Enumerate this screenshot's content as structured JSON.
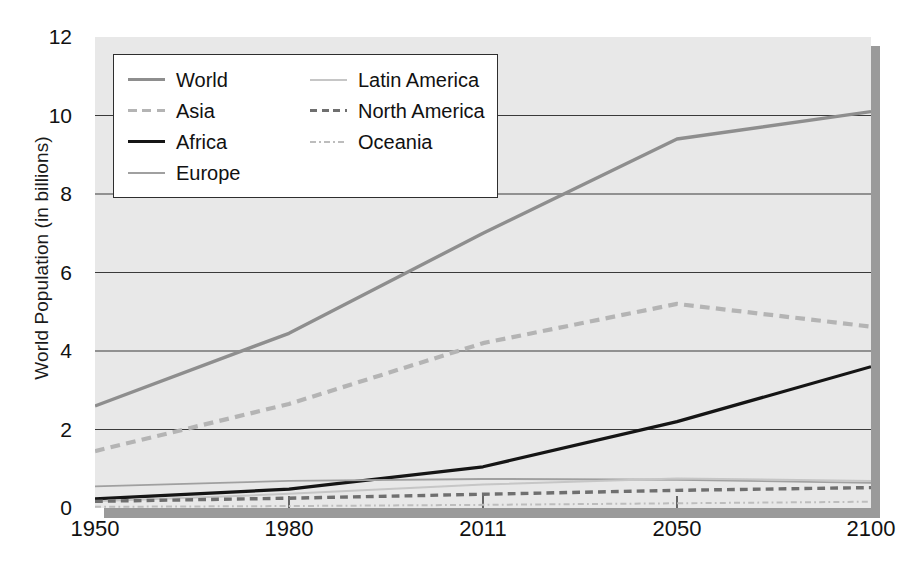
{
  "chart_data": {
    "type": "line",
    "title": "",
    "xlabel": "",
    "ylabel": "World Population (in billions)",
    "xtick_labels": [
      "1950",
      "1980",
      "2011",
      "2050",
      "2100"
    ],
    "x": [
      1950,
      1980,
      2011,
      2050,
      2100
    ],
    "ytick_labels": [
      "0",
      "2",
      "4",
      "6",
      "8",
      "10",
      "12"
    ],
    "ylim": [
      0,
      12
    ],
    "grid": "horizontal",
    "legend_position": "top-left-inside",
    "series": [
      {
        "name": "World",
        "values": [
          2.6,
          4.45,
          7.0,
          9.4,
          10.1
        ],
        "color": "#8e8e8e",
        "style": "solid",
        "width": 3.4
      },
      {
        "name": "Asia",
        "values": [
          1.45,
          2.65,
          4.2,
          5.2,
          4.62
        ],
        "color": "#b4b4b4",
        "style": "dashed",
        "width": 4.2
      },
      {
        "name": "Africa",
        "values": [
          0.23,
          0.48,
          1.05,
          2.2,
          3.6
        ],
        "color": "#151515",
        "style": "solid",
        "width": 3.2
      },
      {
        "name": "Europe",
        "values": [
          0.55,
          0.69,
          0.74,
          0.72,
          0.64
        ],
        "color": "#a0a0a0",
        "style": "solid",
        "width": 1.9
      },
      {
        "name": "Latin America",
        "values": [
          0.17,
          0.36,
          0.6,
          0.75,
          0.69
        ],
        "color": "#c6c6c6",
        "style": "solid",
        "width": 2.0
      },
      {
        "name": "North America",
        "values": [
          0.17,
          0.25,
          0.35,
          0.45,
          0.52
        ],
        "color": "#6f6f6f",
        "style": "dashed",
        "width": 3.4
      },
      {
        "name": "Oceania",
        "values": [
          0.03,
          0.05,
          0.08,
          0.12,
          0.16
        ],
        "color": "#bdbdbd",
        "style": "dashdot",
        "width": 2.0
      }
    ]
  },
  "legend": {
    "left_column": [
      {
        "label": "World",
        "swatch": "solid-gray-line"
      },
      {
        "label": "Asia",
        "swatch": "dashed-light-gray-line"
      },
      {
        "label": "Africa",
        "swatch": "solid-black-line"
      },
      {
        "label": "Europe",
        "swatch": "solid-light-gray-line"
      }
    ],
    "right_column": [
      {
        "label": "Latin America",
        "swatch": "solid-pale-gray-line"
      },
      {
        "label": "North America",
        "swatch": "dashed-dark-gray-line"
      },
      {
        "label": "Oceania",
        "swatch": "dashdot-pale-gray-line"
      }
    ]
  },
  "colors": {
    "plot_background": "#e8e8e8",
    "plot_shadow": "#9a9a9a",
    "gridline": "#3a3a3a",
    "text": "#111111"
  }
}
